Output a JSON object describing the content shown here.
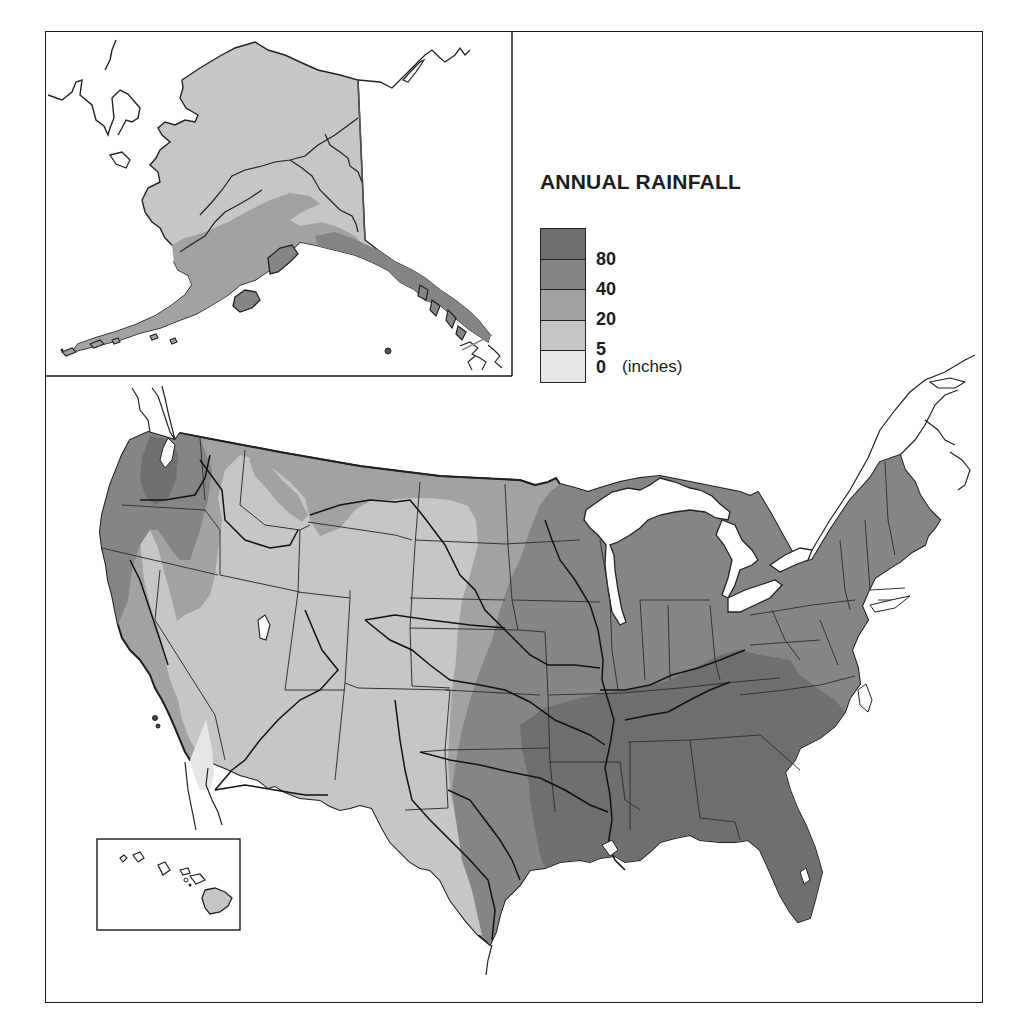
{
  "legend": {
    "title": "ANNUAL RAINFALL",
    "unit": "(inches)",
    "bands": [
      {
        "label": "80",
        "color": "#6f6f6f",
        "range": "80+"
      },
      {
        "label": "40",
        "color": "#858585",
        "range": "40-80"
      },
      {
        "label": "20",
        "color": "#a2a2a2",
        "range": "20-40"
      },
      {
        "label": "5",
        "color": "#c6c6c6",
        "range": "5-20"
      },
      {
        "label": "0",
        "color": "#e6e6e6",
        "range": "0-5"
      }
    ]
  },
  "insets": {
    "alaska": {
      "name": "Alaska"
    },
    "hawaii": {
      "name": "Hawaii"
    }
  },
  "main_map": {
    "name": "Contiguous United States"
  },
  "colors": {
    "zone_80": "#6f6f6f",
    "zone_40": "#858585",
    "zone_20": "#a2a2a2",
    "zone_5": "#c6c6c6",
    "zone_0": "#e6e6e6",
    "border": "#2a2a2a",
    "water": "#ffffff"
  }
}
